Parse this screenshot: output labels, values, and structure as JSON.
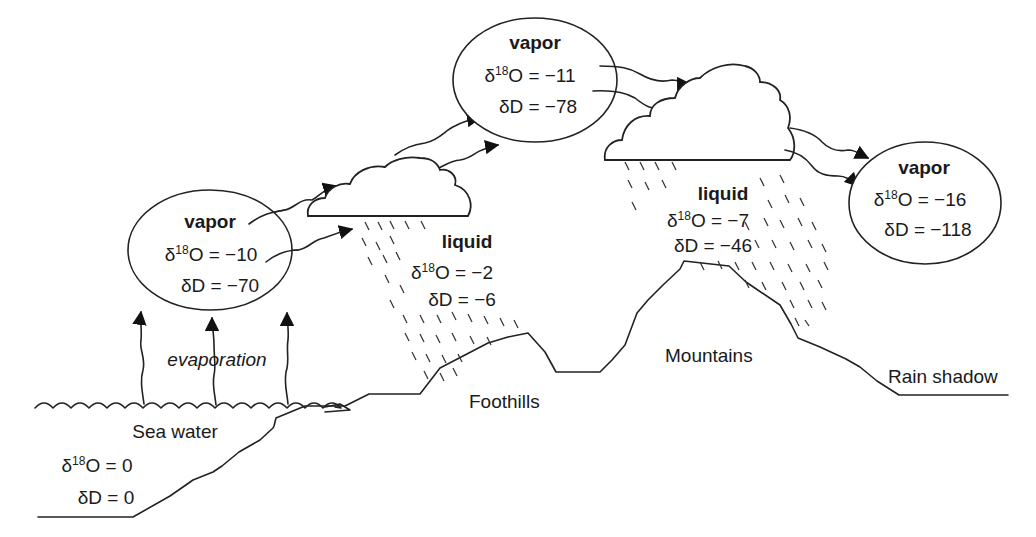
{
  "diagram": {
    "type": "isotope-fractionation-water-cycle",
    "vapor_boxes": [
      {
        "id": "vapor-1",
        "title": "vapor",
        "d18O_label": "δ",
        "d18O_sup": "18",
        "d18O_rest": "O = −10",
        "dD": "δD = −70"
      },
      {
        "id": "vapor-2",
        "title": "vapor",
        "d18O_label": "δ",
        "d18O_sup": "18",
        "d18O_rest": "O = −11",
        "dD": "δD = −78"
      },
      {
        "id": "vapor-3",
        "title": "vapor",
        "d18O_label": "δ",
        "d18O_sup": "18",
        "d18O_rest": "O = −16",
        "dD": "δD = −118"
      }
    ],
    "liquid_labels": [
      {
        "id": "liquid-1",
        "title": "liquid",
        "d18O_label": "δ",
        "d18O_sup": "18",
        "d18O_rest": "O = −2",
        "dD": "δD = −6"
      },
      {
        "id": "liquid-2",
        "title": "liquid",
        "d18O_label": "δ",
        "d18O_sup": "18",
        "d18O_rest": "O = −7",
        "dD": "δD = −46"
      }
    ],
    "sea_water": {
      "title": "Sea water",
      "d18O_label": "δ",
      "d18O_sup": "18",
      "d18O_rest": "O = 0",
      "dD": "δD = 0"
    },
    "process_label": "evaporation",
    "terrain_labels": {
      "foothills": "Foothills",
      "mountains": "Mountains",
      "rain_shadow": "Rain shadow"
    }
  }
}
